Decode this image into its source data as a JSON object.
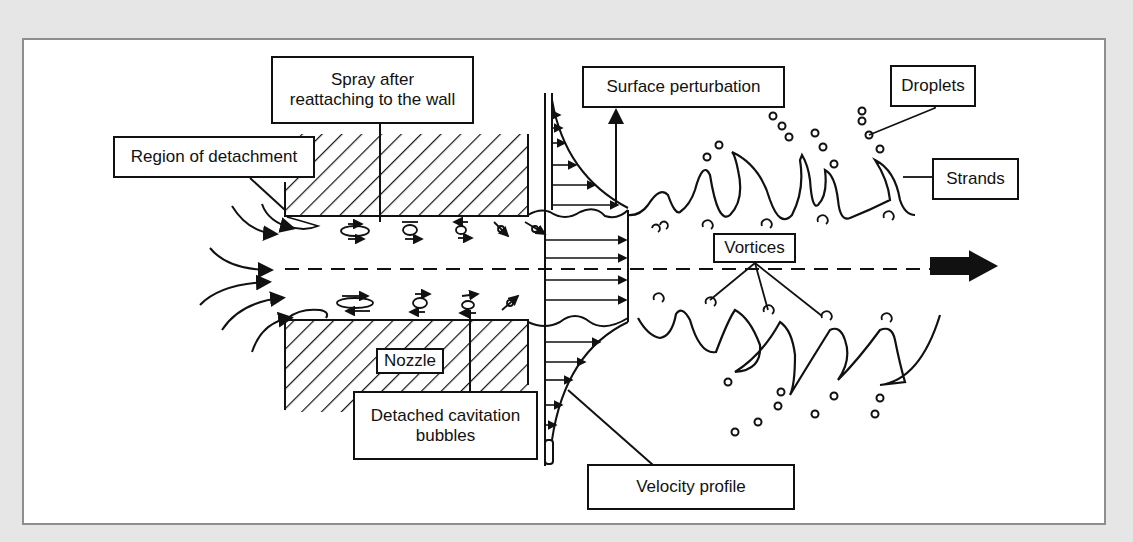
{
  "diagram": {
    "colors": {
      "background": "#e6e6e6",
      "frame": "#ffffff",
      "frame_border": "#8e8e8e",
      "ink": "#111111"
    },
    "labels": {
      "spray_reattaching": "Spray after reattaching to the wall",
      "spray_reattaching_line1": "Spray after",
      "spray_reattaching_line2": "reattaching to the wall",
      "region_of_detachment": "Region of detachment",
      "surface_perturbation": "Surface perturbation",
      "droplets": "Droplets",
      "strands": "Strands",
      "vortices": "Vortices",
      "nozzle": "Nozzle",
      "detached_cavitation_line1": "Detached cavitation",
      "detached_cavitation_line2": "bubbles",
      "velocity_profile": "Velocity profile"
    },
    "icons": {
      "flow_direction": "right-arrow-icon",
      "perturbation_direction": "up-arrow-icon"
    }
  }
}
